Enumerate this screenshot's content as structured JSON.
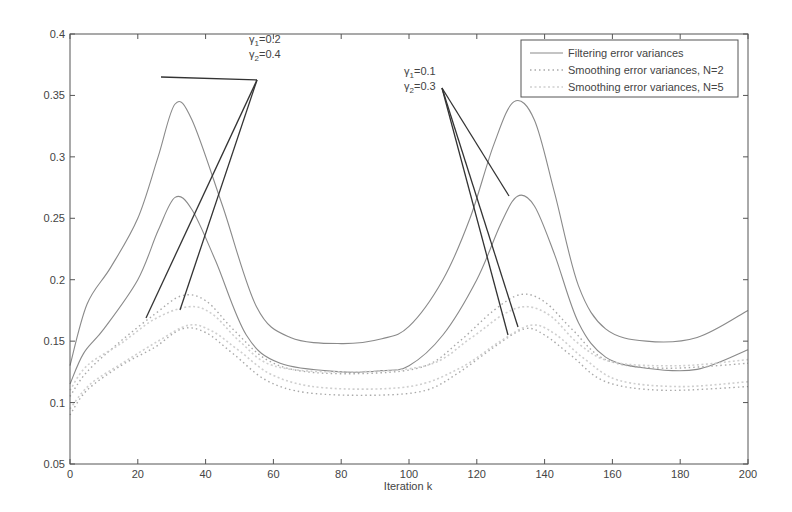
{
  "chart_data": {
    "type": "line",
    "title": "",
    "xlabel": "Iteration k",
    "ylabel": "",
    "xlim": [
      0,
      200
    ],
    "ylim": [
      0.05,
      0.4
    ],
    "xticks": [
      0,
      20,
      40,
      60,
      80,
      100,
      120,
      140,
      160,
      180,
      200
    ],
    "yticks": [
      0.05,
      0.1,
      0.15,
      0.2,
      0.25,
      0.3,
      0.35,
      0.4
    ],
    "ytick_labels": [
      "0.05",
      "0.1",
      "0.15",
      "0.2",
      "0.25",
      "0.3",
      "0.35",
      "0.4"
    ],
    "grid": false,
    "legend_position": "upper right",
    "legend": [
      {
        "label": "Filtering error variances",
        "style": "solid"
      },
      {
        "label": "Smoothing error variances, N=2",
        "style": "dotted"
      },
      {
        "label": "Smoothing error variances, N=5",
        "style": "faint-dotted"
      }
    ],
    "annotations": [
      {
        "line1": "γ1=0.2",
        "line2": "γ2=0.4",
        "sub1": "1",
        "sub2": "2",
        "val1": "=0.2",
        "val2": "=0.4"
      },
      {
        "line1": "γ1=0.1",
        "line2": "γ2=0.3",
        "sub1": "1",
        "sub2": "2",
        "val1": "=0.1",
        "val2": "=0.3"
      }
    ],
    "series": [
      {
        "name": "Filtering error variances (upper)",
        "style": "solid",
        "x": [
          0,
          5,
          12,
          20,
          26,
          31,
          36,
          45,
          55,
          65,
          80,
          92,
          100,
          110,
          118,
          125,
          131,
          137,
          143,
          150,
          158,
          170,
          185,
          200
        ],
        "values": [
          0.13,
          0.18,
          0.21,
          0.25,
          0.3,
          0.343,
          0.33,
          0.26,
          0.178,
          0.153,
          0.148,
          0.152,
          0.162,
          0.2,
          0.25,
          0.31,
          0.345,
          0.33,
          0.27,
          0.195,
          0.16,
          0.15,
          0.153,
          0.175
        ]
      },
      {
        "name": "Filtering error variances (lower)",
        "style": "solid",
        "x": [
          0,
          4,
          10,
          20,
          26,
          31,
          36,
          43,
          52,
          62,
          80,
          92,
          100,
          110,
          120,
          127,
          132,
          137,
          143,
          150,
          158,
          170,
          185,
          200
        ],
        "values": [
          0.115,
          0.14,
          0.16,
          0.2,
          0.24,
          0.267,
          0.257,
          0.215,
          0.155,
          0.132,
          0.125,
          0.126,
          0.13,
          0.155,
          0.2,
          0.245,
          0.268,
          0.26,
          0.22,
          0.165,
          0.137,
          0.128,
          0.127,
          0.143
        ]
      },
      {
        "name": "Smoothing error variances, N=2 (upper)",
        "style": "dotted",
        "x": [
          0,
          5,
          15,
          25,
          33,
          40,
          48,
          58,
          70,
          90,
          105,
          115,
          125,
          133,
          140,
          148,
          158,
          175,
          200
        ],
        "values": [
          0.105,
          0.125,
          0.15,
          0.172,
          0.187,
          0.183,
          0.16,
          0.135,
          0.125,
          0.124,
          0.13,
          0.15,
          0.175,
          0.188,
          0.182,
          0.16,
          0.135,
          0.128,
          0.132
        ]
      },
      {
        "name": "Smoothing error variances, N=5 (upper)",
        "style": "faint-dotted",
        "x": [
          0,
          5,
          15,
          25,
          35,
          42,
          50,
          60,
          80,
          105,
          118,
          128,
          135,
          142,
          150,
          160,
          180,
          200
        ],
        "values": [
          0.11,
          0.13,
          0.148,
          0.168,
          0.178,
          0.172,
          0.15,
          0.13,
          0.125,
          0.13,
          0.152,
          0.172,
          0.178,
          0.17,
          0.148,
          0.133,
          0.13,
          0.135
        ]
      },
      {
        "name": "Smoothing error variances, N=2 (lower)",
        "style": "dotted",
        "x": [
          0,
          5,
          15,
          25,
          33,
          40,
          48,
          58,
          70,
          90,
          105,
          115,
          125,
          134,
          140,
          148,
          158,
          175,
          200
        ],
        "values": [
          0.09,
          0.11,
          0.13,
          0.145,
          0.16,
          0.157,
          0.14,
          0.118,
          0.108,
          0.106,
          0.11,
          0.125,
          0.145,
          0.16,
          0.155,
          0.138,
          0.117,
          0.11,
          0.113
        ]
      },
      {
        "name": "Smoothing error variances, N=5 (lower)",
        "style": "faint-dotted",
        "x": [
          0,
          6,
          16,
          26,
          35,
          42,
          50,
          60,
          75,
          100,
          115,
          127,
          136,
          143,
          152,
          162,
          180,
          200
        ],
        "values": [
          0.095,
          0.115,
          0.133,
          0.15,
          0.163,
          0.158,
          0.142,
          0.122,
          0.112,
          0.113,
          0.128,
          0.15,
          0.163,
          0.156,
          0.135,
          0.118,
          0.113,
          0.117
        ]
      }
    ]
  },
  "colors": {
    "axis": "#555555",
    "filter_line": "#8a8a8a",
    "smooth_n2": "#a9a9a9",
    "smooth_n5": "#cfcfcf",
    "annotation_line": "#333333",
    "text": "#444444"
  }
}
